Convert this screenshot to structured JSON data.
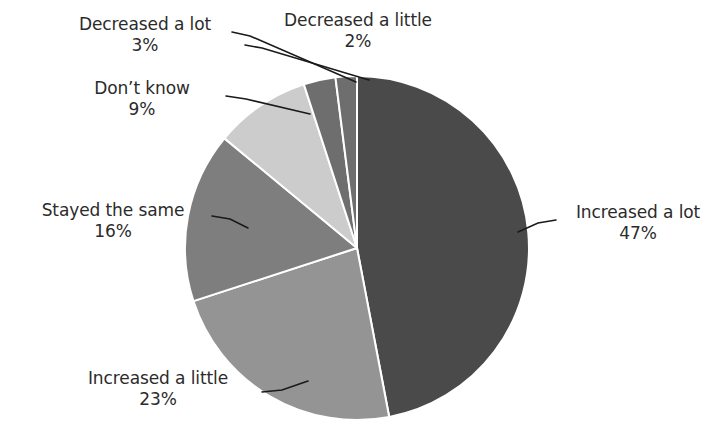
{
  "chart_data": {
    "type": "pie",
    "title": "",
    "subtitle": "",
    "xlabel": "",
    "ylabel": "",
    "legend_position": "none",
    "grid": false,
    "labels_style": "callout-with-leader-lines",
    "start_angle_deg": 0,
    "direction": "clockwise",
    "categories": [
      "Increased a lot",
      "Increased a little",
      "Stayed the same",
      "Don't know",
      "Decreased a lot",
      "Decreased a little"
    ],
    "values": [
      47,
      23,
      16,
      9,
      3,
      2
    ],
    "value_labels": [
      "47%",
      "23%",
      "16%",
      "9%",
      "3%",
      "2%"
    ],
    "units": "percent",
    "total": 100,
    "slices": [
      {
        "name": "Increased a lot",
        "value": 47,
        "value_label": "47%",
        "color": "#4a4a4a",
        "start_deg": 0,
        "end_deg": 169.2
      },
      {
        "name": "Increased a little",
        "value": 23,
        "value_label": "23%",
        "color": "#949494",
        "start_deg": 169.2,
        "end_deg": 252.0
      },
      {
        "name": "Stayed the same",
        "value": 16,
        "value_label": "16%",
        "color": "#7e7e7e",
        "start_deg": 252.0,
        "end_deg": 309.6
      },
      {
        "name": "Don't know",
        "value": 9,
        "value_label": "9%",
        "color": "#cccccc",
        "start_deg": 309.6,
        "end_deg": 342.0
      },
      {
        "name": "Decreased a lot",
        "value": 3,
        "value_label": "3%",
        "color": "#6e6e6e",
        "start_deg": 342.0,
        "end_deg": 352.8
      },
      {
        "name": "Decreased a little",
        "value": 2,
        "value_label": "2%",
        "color": "#6e6e6e",
        "start_deg": 352.8,
        "end_deg": 360.0
      }
    ]
  },
  "labels": {
    "increased_a_lot": {
      "name": "Increased a lot",
      "pct": "47%"
    },
    "increased_a_little": {
      "name": "Increased a little",
      "pct": "23%"
    },
    "stayed_the_same": {
      "name": "Stayed the same",
      "pct": "16%"
    },
    "dont_know": {
      "name": "Don’t know",
      "pct": "9%"
    },
    "decreased_a_lot": {
      "name": "Decreased a lot",
      "pct": "3%"
    },
    "decreased_a_little": {
      "name": "Decreased a little",
      "pct": "2%"
    }
  },
  "colors": {
    "background": "#ffffff",
    "text": "#2b2b2b",
    "leader_line": "#1a1a1a",
    "slice_separator": "#ffffff",
    "increased_a_lot": "#4a4a4a",
    "increased_a_little": "#949494",
    "stayed_the_same": "#7e7e7e",
    "dont_know": "#cccccc",
    "decreased_a_lot": "#6e6e6e",
    "decreased_a_little": "#6e6e6e"
  }
}
